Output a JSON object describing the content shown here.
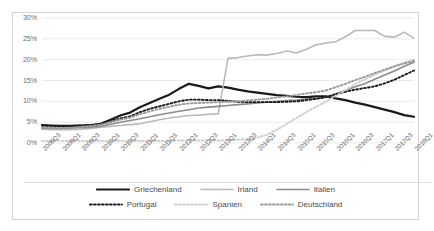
{
  "chart_data": {
    "type": "line",
    "title": "",
    "xlabel": "",
    "ylabel": "",
    "ylim": [
      0,
      30
    ],
    "ytick_labels": [
      "0%",
      "5%",
      "10%",
      "15%",
      "20%",
      "25%",
      "30%"
    ],
    "ytick_values": [
      0,
      5,
      10,
      15,
      20,
      25,
      30
    ],
    "grid": "horizontal",
    "legend_position": "bottom",
    "categories": [
      "2008Q3",
      "2008Q4",
      "2009Q1",
      "2009Q2",
      "2009Q3",
      "2009Q4",
      "2010Q1",
      "2010Q2",
      "2010Q3",
      "2010Q4",
      "2011Q1",
      "2011Q2",
      "2011Q3",
      "2011Q4",
      "2012Q1",
      "2012Q2",
      "2012Q3",
      "2012Q4",
      "2013Q1",
      "2013Q2",
      "2013Q3",
      "2013Q4",
      "2014Q1",
      "2014Q2",
      "2014Q3",
      "2014Q4",
      "2015Q1",
      "2015Q2",
      "2015Q3",
      "2015Q4",
      "2016Q1",
      "2016Q2",
      "2016Q3",
      "2016Q4",
      "2017Q1",
      "2017Q2",
      "2017Q3",
      "2017Q4",
      "2018Q1"
    ],
    "xtick_labels": [
      "2008Q3",
      "2009Q1",
      "2009Q3",
      "2010Q1",
      "2010Q3",
      "2011Q1",
      "2011Q3",
      "2012Q1",
      "2012Q3",
      "2013Q1",
      "2013Q3",
      "2014Q1",
      "2014Q3",
      "2015Q1",
      "2015Q3",
      "2016Q1",
      "2016Q3",
      "2017Q1",
      "2017Q3",
      "2018Q1"
    ],
    "series": [
      {
        "name": "Griechenland",
        "color": "#1a1a1a",
        "style": "solid",
        "width": 2.2,
        "values": [
          4.3,
          4.2,
          4.1,
          4.1,
          4.2,
          4.3,
          4.6,
          5.6,
          6.6,
          7.3,
          8.6,
          9.6,
          10.6,
          11.6,
          13.0,
          14.2,
          13.7,
          13.1,
          13.6,
          13.3,
          12.8,
          12.4,
          12.1,
          11.8,
          11.5,
          11.3,
          11.1,
          11.0,
          11.2,
          11.2,
          10.7,
          10.3,
          9.7,
          9.2,
          8.6,
          8.0,
          7.4,
          6.7,
          6.3
        ]
      },
      {
        "name": "Irland",
        "color": "#b9b9b9",
        "style": "solid",
        "width": 1.6,
        "values": [
          3.3,
          3.2,
          3.2,
          3.2,
          3.3,
          3.5,
          3.8,
          4.0,
          4.2,
          4.4,
          4.6,
          5.1,
          5.6,
          6.0,
          6.3,
          6.6,
          6.7,
          6.9,
          7.0,
          20.3,
          20.5,
          20.9,
          21.2,
          21.1,
          21.5,
          22.1,
          21.6,
          22.5,
          23.6,
          24.0,
          24.3,
          25.5,
          27.0,
          27.0,
          27.0,
          25.6,
          25.4,
          26.6,
          25.1
        ]
      },
      {
        "name": "Italien",
        "color": "#8c8c8c",
        "style": "solid",
        "width": 1.6,
        "values": [
          3.5,
          3.5,
          3.5,
          3.6,
          3.7,
          3.8,
          4.0,
          4.5,
          5.0,
          5.4,
          5.8,
          6.3,
          6.8,
          7.2,
          7.6,
          8.0,
          8.4,
          8.6,
          8.8,
          9.0,
          9.2,
          9.4,
          9.6,
          9.8,
          10.0,
          10.2,
          10.3,
          10.6,
          10.6,
          11.0,
          11.8,
          12.6,
          13.5,
          14.3,
          15.3,
          16.3,
          17.3,
          18.4,
          19.4
        ]
      },
      {
        "name": "Portugal",
        "color": "#1a1a1a",
        "style": "dotted",
        "width": 1.9,
        "values": [
          4.2,
          4.1,
          4.1,
          4.1,
          4.2,
          4.3,
          4.5,
          5.2,
          5.9,
          6.4,
          7.4,
          8.2,
          8.8,
          9.4,
          10.0,
          10.4,
          10.4,
          10.3,
          10.3,
          10.1,
          9.9,
          9.8,
          9.8,
          9.8,
          9.8,
          9.9,
          10.0,
          10.3,
          10.6,
          11.0,
          11.7,
          12.3,
          12.8,
          13.2,
          13.6,
          14.3,
          15.2,
          16.3,
          17.4
        ]
      },
      {
        "name": "Spanien",
        "color": "#cdcdcd",
        "style": "dotted",
        "width": 1.9,
        "values": [
          0.5,
          0.5,
          0.5,
          0.5,
          0.5,
          0.5,
          0.5,
          0.5,
          0.5,
          0.5,
          0.5,
          0.5,
          0.5,
          0.5,
          0.6,
          0.6,
          0.6,
          0.6,
          0.6,
          0.7,
          0.8,
          0.9,
          1.3,
          2.0,
          3.2,
          4.6,
          6.0,
          7.4,
          8.7,
          9.9,
          11.3,
          12.7,
          14.1,
          15.3,
          16.4,
          17.4,
          18.4,
          19.3,
          20.0
        ]
      },
      {
        "name": "Deutschland",
        "color": "#9a9a9a",
        "style": "dotted",
        "width": 1.9,
        "values": [
          3.6,
          3.6,
          3.6,
          3.7,
          3.9,
          4.1,
          4.4,
          5.0,
          5.6,
          6.1,
          6.9,
          7.6,
          8.2,
          8.7,
          9.2,
          9.5,
          9.6,
          9.7,
          9.8,
          9.9,
          10.0,
          10.2,
          10.4,
          10.6,
          10.9,
          11.2,
          11.5,
          11.9,
          12.2,
          12.6,
          13.4,
          14.2,
          15.1,
          15.9,
          16.8,
          17.6,
          18.4,
          19.1,
          19.7
        ]
      }
    ]
  }
}
